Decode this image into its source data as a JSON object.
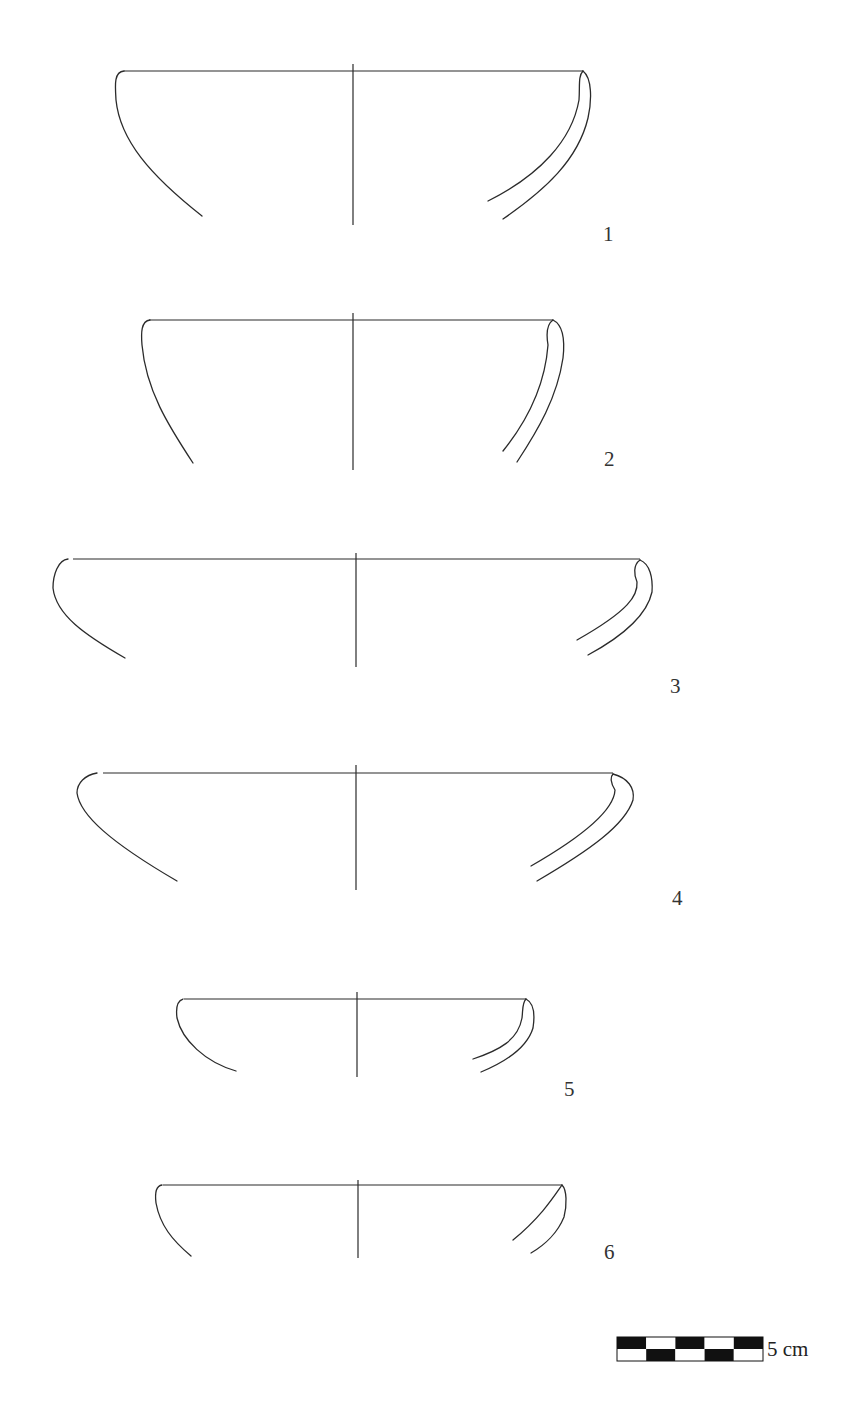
{
  "figure": {
    "stroke_color": "#2b2b2b",
    "background": "#ffffff"
  },
  "vessels": [
    {
      "number": "1",
      "rim_y": 71,
      "left_x": 118,
      "right_x": 583,
      "center": {
        "x": 353,
        "top": 64,
        "bottom": 225
      },
      "left_profile": "M 124 71 C 114 72, 115 84, 116 100 C 120 140, 150 175, 202 216",
      "right_outer": "M 583 71 C 592 78, 592 100, 588 118 C 578 160, 545 190, 503 219",
      "right_inner": "M 583 71 C 578 76, 580 86, 579 100 C 572 140, 540 175, 488 201",
      "label": {
        "x": 603,
        "y": 224
      }
    },
    {
      "number": "2",
      "rim_y": 320,
      "left_x": 143,
      "right_x": 553,
      "center": {
        "x": 353,
        "top": 313,
        "bottom": 470
      },
      "left_profile": "M 150 320 C 141 321, 141 333, 142 345 C 146 390, 168 425, 193 463",
      "right_outer": "M 553 320 C 563 325, 565 340, 563 358 C 557 398, 538 430, 517 462",
      "right_inner": "M 553 320 C 547 324, 546 333, 548 345 C 545 385, 528 420, 503 451",
      "label": {
        "x": 604,
        "y": 449
      }
    },
    {
      "number": "3",
      "rim_y": 559,
      "left_x": 67,
      "right_x": 640,
      "center": {
        "x": 356,
        "top": 553,
        "bottom": 667
      },
      "left_profile": "M 68 559 C 58 560, 53 575, 53 588 C 56 615, 85 635, 125 658",
      "right_outer": "M 640 560 C 650 564, 653 578, 652 592 C 647 615, 625 635, 588 655",
      "right_inner": "M 640 560 C 633 565, 634 575, 637 582 C 638 595, 630 610, 577 640",
      "label": {
        "x": 670,
        "y": 676
      }
    },
    {
      "number": "4",
      "rim_y": 773,
      "left_x": 97,
      "right_x": 613,
      "center": {
        "x": 356,
        "top": 765,
        "bottom": 890
      },
      "left_profile": "M 97 773 C 85 775, 77 783, 77 793 C 80 815, 110 842, 177 881",
      "right_outer": "M 613 774 C 628 778, 635 788, 633 800 C 625 825, 590 850, 537 881",
      "right_inner": "M 613 774 C 609 778, 612 785, 615 790 C 614 810, 585 835, 531 866",
      "label": {
        "x": 672,
        "y": 888
      }
    },
    {
      "number": "5",
      "rim_y": 999,
      "left_x": 178,
      "right_x": 526,
      "center": {
        "x": 357,
        "top": 992,
        "bottom": 1077
      },
      "left_profile": "M 183 999 C 176 1001, 176 1010, 177 1018 C 182 1040, 205 1062, 236 1071",
      "right_outer": "M 526 999 C 534 1003, 535 1015, 533 1028 C 527 1048, 505 1062, 481 1072",
      "right_inner": "M 526 999 C 522 1003, 523 1010, 522 1018 C 518 1040, 500 1050, 473 1059",
      "label": {
        "x": 564,
        "y": 1079
      }
    },
    {
      "number": "6",
      "rim_y": 1185,
      "left_x": 157,
      "right_x": 562,
      "center": {
        "x": 358,
        "top": 1180,
        "bottom": 1258
      },
      "left_profile": "M 162 1185 C 155 1186, 155 1195, 156 1203 C 160 1225, 172 1240, 191 1256",
      "right_outer": "M 562 1185 C 567 1190, 567 1205, 564 1217 C 558 1232, 545 1245, 531 1253",
      "right_inner": "M 562 1185 C 553 1198, 540 1218, 513 1240",
      "label": {
        "x": 604,
        "y": 1242
      }
    }
  ],
  "scale_bar": {
    "x": 617,
    "y": 1337,
    "width": 146,
    "height": 24,
    "segments": 5,
    "top_row": [
      "black",
      "white",
      "black",
      "white",
      "black"
    ],
    "bottom_row": [
      "white",
      "black",
      "white",
      "black",
      "white"
    ],
    "fill_black": "#111111",
    "fill_white": "#ffffff",
    "label": "5 cm",
    "label_x": 767,
    "label_y": 1339
  }
}
